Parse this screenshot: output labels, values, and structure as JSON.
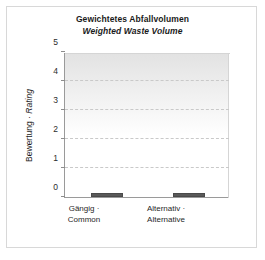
{
  "chart_data": {
    "type": "bar",
    "title": "Gewichtetes Abfallvolumen",
    "subtitle": "Weighted Waste Volume",
    "xlabel": "",
    "ylabel": "Bewertung · Rating",
    "ylabel_de": "Bewertung",
    "ylabel_sep": " · ",
    "ylabel_en": "Rating",
    "categories": [
      "Gängig ·\nCommon",
      "Alternativ ·\nAlternative"
    ],
    "category_lines": [
      [
        "Gängig ·",
        "Common"
      ],
      [
        "Alternativ ·",
        "Alternative"
      ]
    ],
    "values": [
      0.1,
      0.1
    ],
    "ylim": [
      0,
      5
    ],
    "yticks": [
      0,
      1,
      2,
      3,
      4,
      5
    ],
    "ytick_labels": [
      "0",
      "1",
      "2",
      "3",
      "4",
      "5"
    ],
    "grid": true,
    "gridlines_at": [
      1,
      2,
      3,
      4
    ],
    "legend": null,
    "bar_color": "#595959",
    "bar_edge_color": "#4a4a4a",
    "plot_bg_top": "#e2e2e2",
    "plot_bg_bottom": "#ffffff",
    "axis_color": "#9a9a9a",
    "grid_color": "#c9c9c9",
    "card_border_color": "#d8d8d8",
    "text_color": "#1a1a1a"
  }
}
